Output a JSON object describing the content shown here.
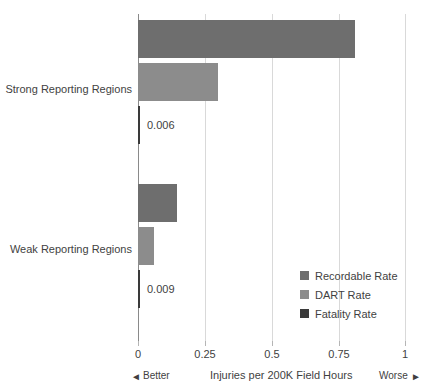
{
  "chart_data": {
    "type": "bar",
    "orientation": "horizontal",
    "title": "",
    "xlabel": "Injuries per 200K Field Hours",
    "ylabel": "",
    "xlim": [
      0,
      1
    ],
    "xticks": [
      "0",
      "0.25",
      "0.5",
      "0.75",
      "1"
    ],
    "xtick_values": [
      0,
      0.25,
      0.5,
      0.75,
      1
    ],
    "grid": true,
    "legend_position": "inside-lower-right",
    "categories": [
      "Strong Reporting Regions",
      "Weak Reporting Regions"
    ],
    "series": [
      {
        "name": "Recordable Rate",
        "color": "#6e6e6e",
        "values": [
          0.81,
          0.145
        ],
        "labels": [
          "",
          ""
        ]
      },
      {
        "name": "DART Rate",
        "color": "#8c8c8c",
        "values": [
          0.3,
          0.06
        ],
        "labels": [
          "",
          ""
        ]
      },
      {
        "name": "Fatality Rate",
        "color": "#3a3a3a",
        "values": [
          0.006,
          0.009
        ],
        "labels": [
          "0.006",
          "0.009"
        ]
      }
    ],
    "direction_hints": {
      "left": "Better",
      "left_arrow": "◄",
      "right": "Worse",
      "right_arrow": "►"
    }
  },
  "legend": {
    "items": [
      {
        "label": "Recordable Rate",
        "color": "#6e6e6e"
      },
      {
        "label": "DART Rate",
        "color": "#8c8c8c"
      },
      {
        "label": "Fatality Rate",
        "color": "#3a3a3a"
      }
    ]
  },
  "axis": {
    "ticks": [
      {
        "label": "0",
        "value": 0
      },
      {
        "label": "0.25",
        "value": 0.25
      },
      {
        "label": "0.5",
        "value": 0.5
      },
      {
        "label": "0.75",
        "value": 0.75
      },
      {
        "label": "1",
        "value": 1
      }
    ],
    "title": "Injuries per 200K Field Hours"
  },
  "categories": [
    {
      "label": "Strong Reporting Regions"
    },
    {
      "label": "Weak Reporting Regions"
    }
  ],
  "bars": [
    {
      "name": "strong-recordable",
      "series": "Recordable Rate",
      "category": "Strong Reporting Regions",
      "value": 0.81,
      "color": "#6e6e6e",
      "label": ""
    },
    {
      "name": "strong-dart",
      "series": "DART Rate",
      "category": "Strong Reporting Regions",
      "value": 0.3,
      "color": "#8c8c8c",
      "label": ""
    },
    {
      "name": "strong-fatality",
      "series": "Fatality Rate",
      "category": "Strong Reporting Regions",
      "value": 0.006,
      "color": "#3a3a3a",
      "label": "0.006"
    },
    {
      "name": "weak-recordable",
      "series": "Recordable Rate",
      "category": "Weak Reporting Regions",
      "value": 0.145,
      "color": "#6e6e6e",
      "label": ""
    },
    {
      "name": "weak-dart",
      "series": "DART Rate",
      "category": "Weak Reporting Regions",
      "value": 0.06,
      "color": "#8c8c8c",
      "label": ""
    },
    {
      "name": "weak-fatality",
      "series": "Fatality Rate",
      "category": "Weak Reporting Regions",
      "value": 0.009,
      "color": "#3a3a3a",
      "label": "0.009"
    }
  ]
}
